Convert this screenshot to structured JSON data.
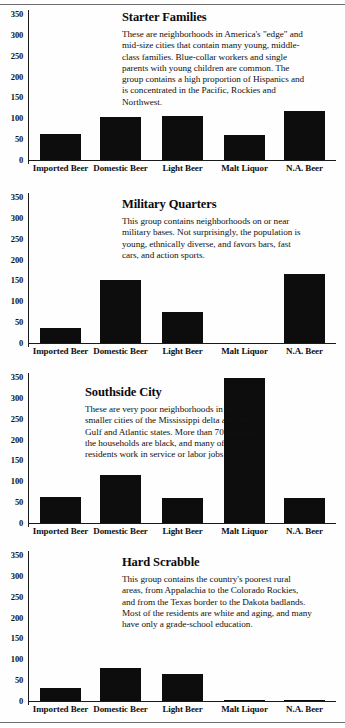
{
  "chart_data": [
    {
      "type": "bar",
      "title": "Starter Families",
      "annotation": "These are neighborhoods in America's \"edge\" and mid-size cities that contain many young, middle-class families.  Blue-collar workers and single parents with young children are common.  The group contains a high proportion of Hispanics and is concentrated in the Pacific, Rockies and Northwest.",
      "categories": [
        "Imported Beer",
        "Domestic Beer",
        "Light Beer",
        "Malt Liquor",
        "N.A. Beer"
      ],
      "values": [
        62,
        103,
        105,
        59,
        118
      ],
      "xlabel": "",
      "ylabel": "",
      "ylim": [
        0,
        350
      ],
      "yticks": [
        0,
        50,
        100,
        150,
        200,
        250,
        300,
        350
      ],
      "grid": false,
      "legend": "none",
      "bar_color": "#0d0d0d"
    },
    {
      "type": "bar",
      "title": "Military Quarters",
      "annotation": "This group contains neighborhoods on or near military bases.  Not surprisingly, the population is young, ethnically diverse, and favors bars, fast cars, and action sports.",
      "categories": [
        "Imported Beer",
        "Domestic Beer",
        "Light Beer",
        "Malt Liquor",
        "N.A. Beer"
      ],
      "values": [
        35,
        152,
        74,
        0,
        165
      ],
      "xlabel": "",
      "ylabel": "",
      "ylim": [
        0,
        350
      ],
      "yticks": [
        0,
        50,
        100,
        150,
        200,
        250,
        300,
        350
      ],
      "grid": false,
      "legend": "none",
      "bar_color": "#0d0d0d"
    },
    {
      "type": "bar",
      "title": "Southside City",
      "annotation": "These are very poor neighborhoods in the smaller cities of the Mississippi delta and the Gulf and Atlantic states.  More than 70 percent of the households are black, and many of the residents work in service or labor jobs.",
      "categories": [
        "Imported Beer",
        "Domestic Beer",
        "Light Beer",
        "Malt Liquor",
        "N.A. Beer"
      ],
      "values": [
        63,
        115,
        60,
        348,
        60
      ],
      "xlabel": "",
      "ylabel": "",
      "ylim": [
        0,
        350
      ],
      "yticks": [
        0,
        50,
        100,
        150,
        200,
        250,
        300,
        350
      ],
      "grid": false,
      "legend": "none",
      "bar_color": "#0d0d0d"
    },
    {
      "type": "bar",
      "title": "Hard Scrabble",
      "annotation": "This group contains the country's poorest rural areas, from Appalachia to the Colorado Rockies, and from the Texas border to the Dakota badlands.  Most of the residents are white and aging, and many have only a grade-school education.",
      "categories": [
        "Imported Beer",
        "Domestic Beer",
        "Light Beer",
        "Malt Liquor",
        "N.A. Beer"
      ],
      "values": [
        31,
        78,
        65,
        3,
        3
      ],
      "xlabel": "",
      "ylabel": "",
      "ylim": [
        0,
        350
      ],
      "yticks": [
        0,
        50,
        100,
        150,
        200,
        250,
        300,
        350
      ],
      "grid": false,
      "legend": "none",
      "bar_color": "#0d0d0d"
    }
  ]
}
